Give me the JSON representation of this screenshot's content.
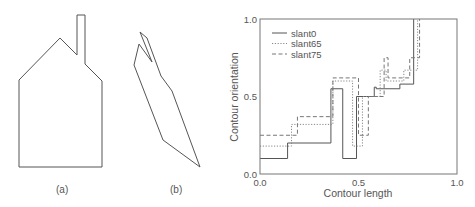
{
  "panels": {
    "a": {
      "label": "(a)"
    },
    "b": {
      "label": "(b)"
    }
  },
  "chart_data": {
    "type": "line",
    "step": true,
    "xlabel": "Contour length",
    "ylabel": "Contour orientation",
    "xlim": [
      0.0,
      1.0
    ],
    "ylim": [
      0.0,
      1.0
    ],
    "xticks": [
      "0.0",
      "0.5",
      "1.0"
    ],
    "yticks": [
      "0.0",
      "0.5",
      "1.0"
    ],
    "grid": false,
    "legend_position": "upper left",
    "series": [
      {
        "name": "slant0",
        "style": "solid",
        "x": [
          0.0,
          0.14,
          0.14,
          0.36,
          0.36,
          0.42,
          0.42,
          0.49,
          0.49,
          0.58,
          0.58,
          0.59,
          0.59,
          0.71,
          0.71,
          0.78,
          0.78
        ],
        "y": [
          0.1,
          0.1,
          0.2,
          0.2,
          0.55,
          0.55,
          0.1,
          0.1,
          0.5,
          0.5,
          0.56,
          0.56,
          0.55,
          0.55,
          0.58,
          0.58,
          1.0
        ]
      },
      {
        "name": "slant65",
        "style": "dotted",
        "x": [
          0.0,
          0.16,
          0.16,
          0.37,
          0.37,
          0.47,
          0.47,
          0.52,
          0.52,
          0.61,
          0.61,
          0.64,
          0.64,
          0.73,
          0.73,
          0.8,
          0.8
        ],
        "y": [
          0.18,
          0.18,
          0.32,
          0.32,
          0.6,
          0.6,
          0.18,
          0.18,
          0.5,
          0.5,
          0.67,
          0.67,
          0.6,
          0.6,
          0.67,
          0.67,
          1.0
        ]
      },
      {
        "name": "slant75",
        "style": "dashed",
        "x": [
          0.0,
          0.19,
          0.19,
          0.37,
          0.37,
          0.5,
          0.5,
          0.55,
          0.55,
          0.63,
          0.63,
          0.65,
          0.65,
          0.76,
          0.76,
          0.81,
          0.81
        ],
        "y": [
          0.25,
          0.25,
          0.37,
          0.37,
          0.62,
          0.62,
          0.25,
          0.25,
          0.5,
          0.5,
          0.75,
          0.75,
          0.62,
          0.62,
          0.75,
          0.75,
          1.0
        ]
      }
    ]
  }
}
